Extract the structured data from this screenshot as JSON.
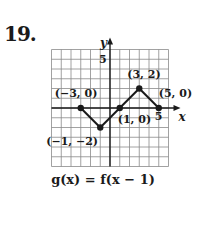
{
  "problem_number": "19.",
  "caption": "g(x) = f(x − 1)",
  "chart_data": {
    "type": "line",
    "title": "",
    "caption": "g(x) = f(x − 1)",
    "xlabel": "x",
    "ylabel": "y",
    "xlim": [
      -6,
      6
    ],
    "ylim": [
      -6,
      6
    ],
    "grid": true,
    "x_tick_labels": [
      {
        "value": 5,
        "label": "5"
      }
    ],
    "y_tick_labels": [
      {
        "value": 5,
        "label": "5"
      }
    ],
    "series": [
      {
        "name": "g(x)",
        "x": [
          -3,
          -1,
          1,
          3,
          5
        ],
        "y": [
          0,
          -2,
          0,
          2,
          0
        ]
      }
    ],
    "annotations": [
      {
        "x": -3,
        "y": 0,
        "text": "(−3, 0)"
      },
      {
        "x": -1,
        "y": -2,
        "text": "(−1, −2)"
      },
      {
        "x": 1,
        "y": 0,
        "text": "(1, 0)"
      },
      {
        "x": 3,
        "y": 2,
        "text": "(3, 2)"
      },
      {
        "x": 5,
        "y": 0,
        "text": "(5, 0)"
      }
    ]
  }
}
